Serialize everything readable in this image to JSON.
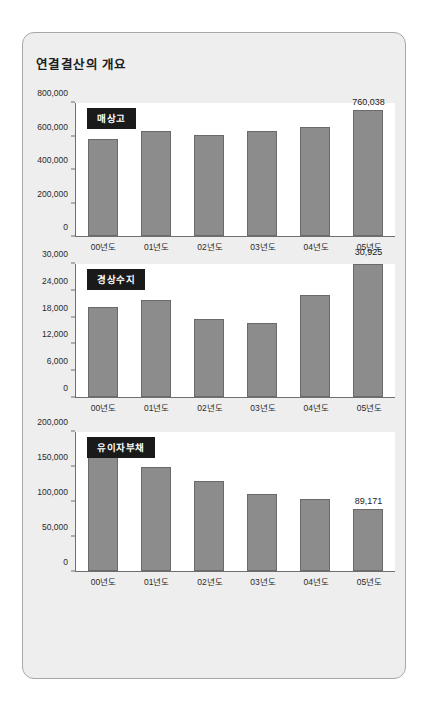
{
  "panel": {
    "title": "연결결산의 개요"
  },
  "chart_data": [
    {
      "type": "bar",
      "title": "매상고",
      "xlabel": "",
      "ylabel": "",
      "categories": [
        "00년도",
        "01년도",
        "02년도",
        "03년도",
        "04년도",
        "05년도"
      ],
      "values": [
        585000,
        630000,
        608000,
        630000,
        655000,
        760038
      ],
      "ylim": [
        0,
        800000
      ],
      "yticks": [
        0,
        200000,
        400000,
        600000,
        800000
      ],
      "ytick_labels": [
        "0",
        "200,000",
        "400,000",
        "600,000",
        "800,000"
      ],
      "data_labels": [
        "",
        "",
        "",
        "",
        "",
        "760,038"
      ],
      "grid": false,
      "legend": "none",
      "bar_color": "#8c8c8c"
    },
    {
      "type": "bar",
      "title": "경상수지",
      "xlabel": "",
      "ylabel": "",
      "categories": [
        "00년도",
        "01년도",
        "02년도",
        "03년도",
        "04년도",
        "05년도"
      ],
      "values": [
        20200,
        21800,
        17700,
        16800,
        22900,
        30925
      ],
      "ylim": [
        0,
        30000
      ],
      "yticks": [
        0,
        6000,
        12000,
        18000,
        24000,
        30000
      ],
      "ytick_labels": [
        "0",
        "6,000",
        "12,000",
        "18,000",
        "24,000",
        "30,000"
      ],
      "data_labels": [
        "",
        "",
        "",
        "",
        "",
        "30,925"
      ],
      "grid": false,
      "legend": "none",
      "bar_color": "#8c8c8c"
    },
    {
      "type": "bar",
      "title": "유이자부채",
      "xlabel": "",
      "ylabel": "",
      "categories": [
        "00년도",
        "01년도",
        "02년도",
        "03년도",
        "04년도",
        "05년도"
      ],
      "values": [
        187000,
        149000,
        130000,
        111000,
        104000,
        89171
      ],
      "ylim": [
        0,
        200000
      ],
      "yticks": [
        0,
        50000,
        100000,
        150000,
        200000
      ],
      "ytick_labels": [
        "0",
        "50,000",
        "100,000",
        "150,000",
        "200,000"
      ],
      "data_labels": [
        "",
        "",
        "",
        "",
        "",
        "89,171"
      ],
      "grid": false,
      "legend": "none",
      "bar_color": "#8c8c8c"
    }
  ]
}
